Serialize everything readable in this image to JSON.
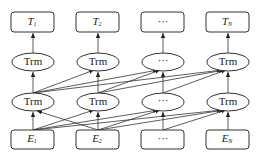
{
  "diagram": {
    "outputs": [
      {
        "label": "T",
        "sub": "1"
      },
      {
        "label": "T",
        "sub": "2"
      },
      {
        "label": "···",
        "sub": ""
      },
      {
        "label": "T",
        "sub": "N"
      }
    ],
    "top_layer": [
      "Trm",
      "Trm",
      "···",
      "Trm"
    ],
    "bottom_layer": [
      "Trm",
      "Trm",
      "···",
      "Trm"
    ],
    "inputs": [
      {
        "label": "E",
        "sub": "1"
      },
      {
        "label": "E",
        "sub": "2"
      },
      {
        "label": "···",
        "sub": ""
      },
      {
        "label": "E",
        "sub": "N"
      }
    ],
    "colors": {
      "stroke": "#333333",
      "background": "#ffffff"
    }
  }
}
